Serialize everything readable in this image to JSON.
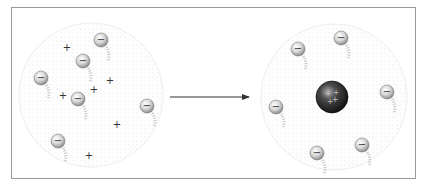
{
  "diagram": {
    "type": "atomic-model-comparison",
    "colors": {
      "frame_border": "#9a9a9a",
      "cloud_dots": "#b8b8b8",
      "electron_fill": "#d8d8d8",
      "electron_stroke": "#7a7a7a",
      "charge_mark": "#333333",
      "nucleus_dark": "#1a1a1a",
      "nucleus_highlight": "#9a9a9a",
      "arrow": "#333333"
    },
    "symbols": {
      "electron": "−",
      "proton": "+",
      "nucleus": "+"
    },
    "left_model": {
      "name": "thomson-plum-pudding-model",
      "cloud": {
        "cx": 91,
        "cy": 95,
        "r": 72
      },
      "electrons": [
        {
          "x": 101,
          "y": 40
        },
        {
          "x": 83,
          "y": 61
        },
        {
          "x": 41,
          "y": 78
        },
        {
          "x": 78,
          "y": 99
        },
        {
          "x": 147,
          "y": 106
        },
        {
          "x": 58,
          "y": 141
        }
      ],
      "protons": [
        {
          "x": 67,
          "y": 47
        },
        {
          "x": 110,
          "y": 80
        },
        {
          "x": 63,
          "y": 95
        },
        {
          "x": 94,
          "y": 89
        },
        {
          "x": 117,
          "y": 124
        },
        {
          "x": 89,
          "y": 155
        }
      ]
    },
    "arrow": {
      "x1": 170,
      "y1": 97,
      "x2": 249,
      "y2": 97
    },
    "right_model": {
      "name": "rutherford-nuclear-model",
      "cloud": {
        "cx": 334,
        "cy": 97,
        "r": 73
      },
      "nucleus": {
        "x": 332,
        "y": 97,
        "r": 16
      },
      "electrons": [
        {
          "x": 298,
          "y": 49
        },
        {
          "x": 341,
          "y": 38
        },
        {
          "x": 387,
          "y": 92
        },
        {
          "x": 276,
          "y": 107
        },
        {
          "x": 362,
          "y": 145
        },
        {
          "x": 317,
          "y": 153
        }
      ]
    }
  }
}
